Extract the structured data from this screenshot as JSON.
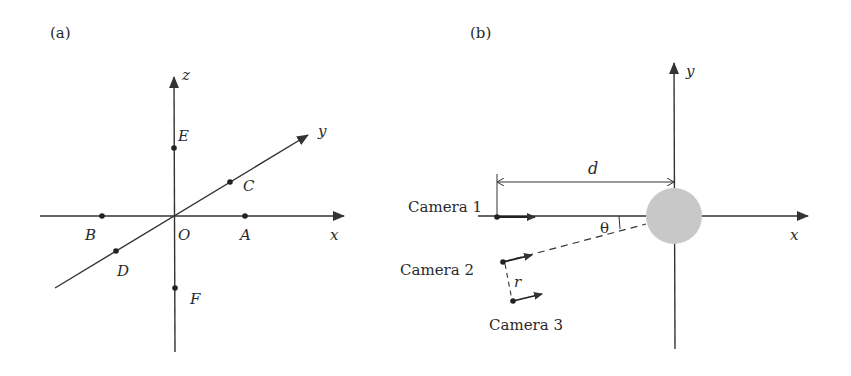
{
  "panel_a": {
    "label": "(a)",
    "axes": {
      "x": "x",
      "y": "y",
      "z": "z"
    },
    "origin": "O",
    "points": [
      {
        "name": "E",
        "label": "E"
      },
      {
        "name": "C",
        "label": "C"
      },
      {
        "name": "B",
        "label": "B"
      },
      {
        "name": "A",
        "label": "A"
      },
      {
        "name": "D",
        "label": "D"
      },
      {
        "name": "F",
        "label": "F"
      }
    ]
  },
  "panel_b": {
    "label": "(b)",
    "axes": {
      "x": "x",
      "y": "y"
    },
    "distance_label": "d",
    "angle_label": "θ",
    "offset_label": "r",
    "cameras": [
      {
        "label": "Camera 1"
      },
      {
        "label": "Camera 2"
      },
      {
        "label": "Camera 3"
      }
    ],
    "object_color": "#c8c8c8"
  },
  "colors": {
    "line": "#333333",
    "object": "#c8c8c8"
  }
}
